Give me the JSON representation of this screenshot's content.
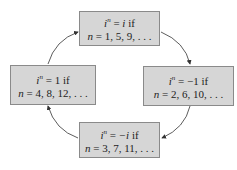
{
  "diagram": {
    "type": "cycle",
    "boxes": [
      {
        "id": "top",
        "base": "i",
        "exp": "n",
        "eq": " = ",
        "value": "i",
        "if": " if",
        "cond_var": "n",
        "cond": " = 1, 5, 9, . . ."
      },
      {
        "id": "right",
        "base": "i",
        "exp": "n",
        "eq": " = ",
        "value": "−1",
        "if": " if",
        "cond_var": "n",
        "cond": " = 2, 6, 10, . . ."
      },
      {
        "id": "bottom",
        "base": "i",
        "exp": "n",
        "eq": " = ",
        "value": "−i",
        "if": " if",
        "cond_var": "n",
        "cond": " = 3, 7, 11, . . ."
      },
      {
        "id": "left",
        "base": "i",
        "exp": "n",
        "eq": " = ",
        "value": "1",
        "if": " if",
        "cond_var": "n",
        "cond": " = 4, 8, 12, . . ."
      }
    ],
    "arrows": [
      {
        "from": "top",
        "to": "right"
      },
      {
        "from": "right",
        "to": "bottom"
      },
      {
        "from": "bottom",
        "to": "left"
      },
      {
        "from": "left",
        "to": "top"
      }
    ],
    "colors": {
      "box_fill": "#d6d6d6",
      "box_border": "#8a8a8a",
      "arrow": "#333333"
    }
  }
}
